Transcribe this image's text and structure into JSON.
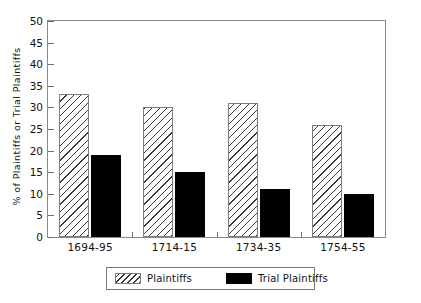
{
  "chart_data": {
    "type": "bar",
    "title": "",
    "xlabel": "",
    "ylabel": "% of Plaintiffs or Trial Plaintiffs",
    "categories": [
      "1694-95",
      "1714-15",
      "1734-35",
      "1754-55"
    ],
    "series": [
      {
        "name": "Plaintiffs",
        "values": [
          33,
          30,
          31,
          26
        ],
        "fill": "diagonal-hatch",
        "color": "#ffffff"
      },
      {
        "name": "Trial Plaintiffs",
        "values": [
          19,
          15,
          11,
          10
        ],
        "fill": "solid",
        "color": "#000000"
      }
    ],
    "ylim": [
      0,
      50
    ],
    "ytick_step": 5,
    "yticks": [
      0,
      5,
      10,
      15,
      20,
      25,
      30,
      35,
      40,
      45,
      50
    ],
    "ytick_labels": [
      "0",
      "5",
      "10",
      "15",
      "20",
      "25",
      "30",
      "35",
      "40",
      "45",
      "50"
    ],
    "grid": false,
    "frame": true,
    "legend_position": "bottom-center"
  },
  "legend": {
    "items": [
      {
        "label": "Plaintiffs"
      },
      {
        "label": "Trial Plaintiffs"
      }
    ]
  }
}
